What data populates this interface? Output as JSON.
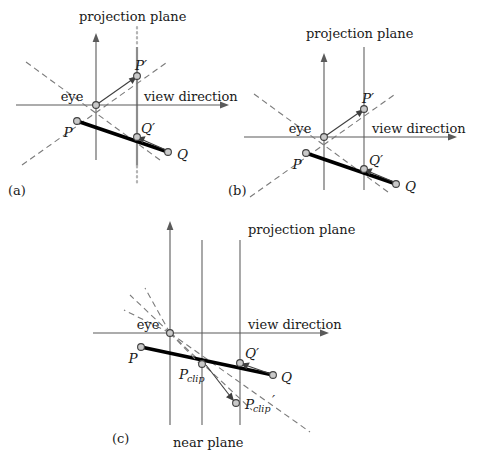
{
  "figure": {
    "panels": [
      {
        "id": "a",
        "panel_label": "(a)",
        "title": "projection plane",
        "axis_label": "view direction",
        "origin_label": "eye",
        "points": [
          {
            "name": "P",
            "label": "P"
          },
          {
            "name": "P-prime",
            "label": "P′"
          },
          {
            "name": "Q",
            "label": "Q"
          },
          {
            "name": "Q-prime",
            "label": "Q′"
          }
        ]
      },
      {
        "id": "b",
        "panel_label": "(b)",
        "title": "projection plane",
        "axis_label": "view direction",
        "origin_label": "eye",
        "points": [
          {
            "name": "P",
            "label": "P"
          },
          {
            "name": "P-prime",
            "label": "P′"
          },
          {
            "name": "Q",
            "label": "Q"
          },
          {
            "name": "Q-prime",
            "label": "Q′"
          }
        ]
      },
      {
        "id": "c",
        "panel_label": "(c)",
        "title": "projection plane",
        "axis_label": "view direction",
        "origin_label": "eye",
        "near_plane_label": "near plane",
        "points": [
          {
            "name": "P",
            "label": "P"
          },
          {
            "name": "Q",
            "label": "Q"
          },
          {
            "name": "Q-prime",
            "label": "Q′"
          },
          {
            "name": "P-clip",
            "label": "P",
            "subscript": "clip"
          },
          {
            "name": "P-clip-prime",
            "label": "P",
            "subscript": "clip",
            "prime": "′"
          }
        ]
      }
    ]
  },
  "colors": {
    "plane": "#8d8d8d",
    "axis": "#5a5a5a",
    "dashed_ray": "#7b7b7b",
    "segment": "#000000",
    "dot_fill": "#c9c9c9",
    "dot_stroke": "#404040",
    "text": "#1a1a1a"
  }
}
